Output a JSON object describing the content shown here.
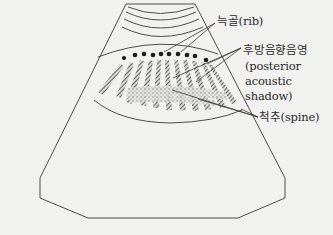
{
  "diagram": {
    "labels": {
      "rib": "늑골(rib)",
      "shadow_ko": "후방음향음영",
      "shadow_en_1": "(posterior",
      "shadow_en_2": "acoustic",
      "shadow_en_3": "shadow)",
      "spine": "척추(spine)"
    },
    "colors": {
      "background": "#f1f1ef",
      "line": "#3a3a3a",
      "hatch": "#555555"
    }
  }
}
